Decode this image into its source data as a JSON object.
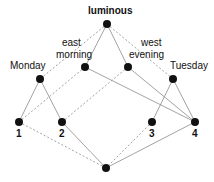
{
  "diagram": {
    "type": "lattice",
    "nodes": [
      {
        "id": "top",
        "label": "luminous",
        "x": 107,
        "y": 24,
        "lx": 88,
        "ly": 6
      },
      {
        "id": "monday",
        "label": "Monday",
        "x": 40,
        "y": 79,
        "lx": 10,
        "ly": 61
      },
      {
        "id": "eastmorning",
        "label": "east\nmorning",
        "label1": "east",
        "label2": "morning",
        "x": 85,
        "y": 67,
        "lx": 56,
        "ly": 38
      },
      {
        "id": "westevening",
        "label": "west\nevening",
        "label1": "west",
        "label2": "evening",
        "x": 128,
        "y": 67,
        "lx": 129,
        "ly": 38
      },
      {
        "id": "tuesday",
        "label": "Tuesday",
        "x": 173,
        "y": 79,
        "lx": 170,
        "ly": 61
      },
      {
        "id": "n1",
        "label": "1",
        "x": 19,
        "y": 122,
        "lx": 16,
        "ly": 129
      },
      {
        "id": "n2",
        "label": "2",
        "x": 62,
        "y": 122,
        "lx": 59,
        "ly": 129
      },
      {
        "id": "n3",
        "label": "3",
        "x": 152,
        "y": 122,
        "lx": 149,
        "ly": 129
      },
      {
        "id": "n4",
        "label": "4",
        "x": 195,
        "y": 122,
        "lx": 192,
        "ly": 129
      },
      {
        "id": "bottom",
        "label": "",
        "x": 106,
        "y": 168
      }
    ],
    "edges": [
      {
        "from": "top",
        "to": "monday",
        "style": "dashed"
      },
      {
        "from": "top",
        "to": "eastmorning",
        "style": "solid"
      },
      {
        "from": "top",
        "to": "westevening",
        "style": "solid"
      },
      {
        "from": "top",
        "to": "tuesday",
        "style": "dashed"
      },
      {
        "from": "monday",
        "to": "n1",
        "style": "solid"
      },
      {
        "from": "monday",
        "to": "n2",
        "style": "solid"
      },
      {
        "from": "eastmorning",
        "to": "n1",
        "style": "dashed"
      },
      {
        "from": "eastmorning",
        "to": "n4",
        "style": "solid"
      },
      {
        "from": "westevening",
        "to": "n2",
        "style": "dashed"
      },
      {
        "from": "westevening",
        "to": "n4",
        "style": "solid"
      },
      {
        "from": "tuesday",
        "to": "n3",
        "style": "solid"
      },
      {
        "from": "tuesday",
        "to": "n4",
        "style": "solid"
      },
      {
        "from": "n1",
        "to": "bottom",
        "style": "dashed"
      },
      {
        "from": "n2",
        "to": "bottom",
        "style": "solid"
      },
      {
        "from": "n3",
        "to": "bottom",
        "style": "dashed"
      },
      {
        "from": "n4",
        "to": "bottom",
        "style": "solid"
      }
    ],
    "colors": {
      "node": "#111111",
      "edge": "#8a8a8a",
      "text": "#111111"
    }
  }
}
